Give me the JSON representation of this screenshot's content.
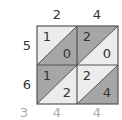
{
  "top_digits": [
    "2",
    "4"
  ],
  "left_digits": [
    "5",
    "6"
  ],
  "bottom_digits": [
    "3",
    "4",
    "4"
  ],
  "cells": [
    {
      "upper": "1",
      "lower": "0"
    },
    {
      "upper": "2",
      "lower": "0"
    },
    {
      "upper": "1",
      "lower": "2"
    },
    {
      "upper": "2",
      "lower": "4"
    }
  ],
  "colors": {
    "light": "#ececec",
    "dark": "#a6a6a6",
    "border": "#555555"
  }
}
